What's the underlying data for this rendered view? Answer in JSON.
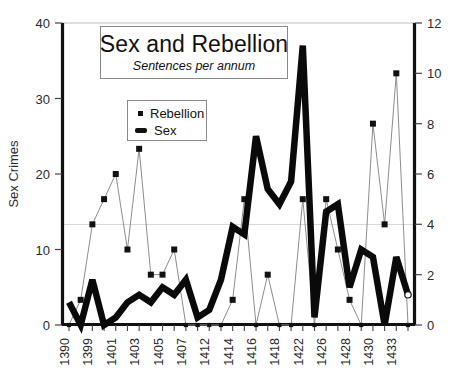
{
  "chart": {
    "title": "Sex and Rebellion",
    "subtitle": "Sentences per annum",
    "left_axis_label": "Sex Crimes",
    "right_axis_label": "",
    "legend": [
      {
        "name": "Rebellion",
        "marker": "square-marker-icon"
      },
      {
        "name": "Sex",
        "marker": "thick-line-swatch-icon"
      }
    ]
  },
  "chart_data": {
    "type": "line",
    "title": "Sex and Rebellion",
    "subtitle": "Sentences per annum",
    "xlabel": "",
    "ylabel": "Sex Crimes",
    "y2label": "",
    "ylim": [
      0,
      40
    ],
    "y2lim": [
      0,
      12
    ],
    "yticks": [
      0,
      10,
      20,
      30,
      40
    ],
    "y2ticks": [
      0,
      2,
      4,
      6,
      8,
      10,
      12
    ],
    "grid": "faint-horizontal-at-13.3",
    "legend_position": "inside-upper-left",
    "x": [
      "1390",
      "1395",
      "1399",
      "1400",
      "1401",
      "1402",
      "1403",
      "1404",
      "1405",
      "1406",
      "1407",
      "1409",
      "1412",
      "1413",
      "1414",
      "1415",
      "1416",
      "1417",
      "1418",
      "1419",
      "1422",
      "1424",
      "1426",
      "1427",
      "1428",
      "1429",
      "1430",
      "1431",
      "1433",
      "1434"
    ],
    "xtick_labels_shown": [
      "1390",
      "1399",
      "1401",
      "1403",
      "1405",
      "1407",
      "1412",
      "1414",
      "1416",
      "1418",
      "1422",
      "1426",
      "1428",
      "1430",
      "1433"
    ],
    "series": [
      {
        "name": "Sex",
        "axis": "left",
        "style": "thick-black-line",
        "values": [
          3,
          0,
          6,
          0,
          1,
          3,
          4,
          3,
          5,
          4,
          6,
          1,
          2,
          6,
          13,
          12,
          25,
          18,
          16,
          19,
          37,
          1,
          15,
          16,
          5,
          10,
          9,
          0,
          9,
          4
        ]
      },
      {
        "name": "Rebellion",
        "axis": "right",
        "style": "thin-line-square-markers",
        "values": [
          0,
          1,
          4,
          5,
          6,
          3,
          7,
          2,
          2,
          3,
          0,
          0,
          0,
          0,
          1,
          5,
          0,
          2,
          0,
          0,
          5,
          0,
          5,
          3,
          1,
          0,
          8,
          4,
          10,
          0
        ]
      }
    ]
  }
}
